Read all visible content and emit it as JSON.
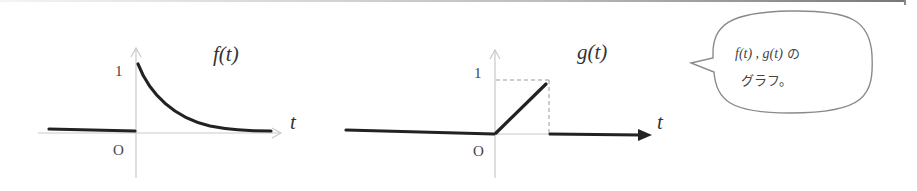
{
  "figure": {
    "graph_f": {
      "title": "f(t)",
      "axis_label_x": "t",
      "tick_y": "1",
      "origin_label": "O",
      "description": "f(t) = 0 for t<0, exponential decay from 1 for t>=0"
    },
    "graph_g": {
      "title": "g(t)",
      "axis_label_x": "t",
      "tick_y": "1",
      "origin_label": "O",
      "description": "g(t) = 0 for t<0, linear ramp from 0 to 1 on [0,1], 0 for t>1"
    },
    "bubble": {
      "line1_math": "f(t) , g(t)",
      "line1_jp": " の",
      "line2": "グラフ。"
    },
    "colors": {
      "curve": "#222222",
      "axis": "#c8c8c8",
      "text": "#444444",
      "bubble_border": "#8a8a8a"
    }
  }
}
